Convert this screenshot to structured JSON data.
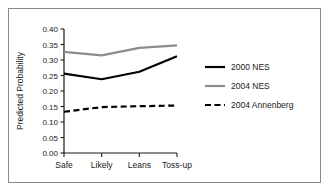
{
  "chart_data": {
    "type": "line",
    "title": "",
    "subtitle": "",
    "xlabel": "",
    "ylabel": "Predicted Probability",
    "categories": [
      "Safe",
      "Likely",
      "Leans",
      "Toss-up"
    ],
    "ylim": [
      0.0,
      0.4
    ],
    "yticks": [
      "0.00",
      "0.05",
      "0.10",
      "0.15",
      "0.20",
      "0.25",
      "0.30",
      "0.35",
      "0.40"
    ],
    "ytick_values": [
      0.0,
      0.05,
      0.1,
      0.15,
      0.2,
      0.25,
      0.3,
      0.35,
      0.4
    ],
    "grid": false,
    "legend_position": "right",
    "series": [
      {
        "name": "2000 NES",
        "values": [
          0.256,
          0.238,
          0.262,
          0.312
        ],
        "color": "#000000",
        "style": "solid",
        "width": 2.2
      },
      {
        "name": "2004 NES",
        "values": [
          0.326,
          0.315,
          0.339,
          0.347
        ],
        "color": "#8c8c8c",
        "style": "solid",
        "width": 2.2
      },
      {
        "name": "2004 Annenberg",
        "values": [
          0.133,
          0.148,
          0.151,
          0.153
        ],
        "color": "#000000",
        "style": "dashed",
        "width": 2.2
      }
    ]
  },
  "axes": {
    "y_axis_label": "Predicted Probability",
    "tick_color": "#1a1a1a",
    "axis_color": "#1a1a1a"
  },
  "legend": {
    "entries": [
      {
        "label": "2000 NES"
      },
      {
        "label": "2004 NES"
      },
      {
        "label": "2004 Annenberg"
      }
    ]
  },
  "colors": {
    "series_black": "#000000",
    "series_gray": "#8c8c8c",
    "frame_border": "#8a8a8a",
    "background": "#ffffff"
  }
}
